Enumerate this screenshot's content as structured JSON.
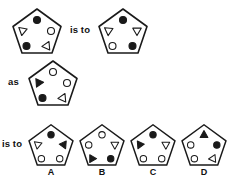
{
  "puzzle": {
    "type": "visual-analogy",
    "connector_1": "is to",
    "connector_2": "as",
    "connector_3": "is to",
    "stroke_color": "#1a1a1a",
    "fill_color": "#1a1a1a",
    "background_color": "#ffffff"
  },
  "premise": {
    "left": {
      "name": "premise-figure-1",
      "shape": "pentagon",
      "elements": [
        {
          "slot": "top",
          "shape": "circle",
          "fill": "filled",
          "rotation": 0
        },
        {
          "slot": "upper-left",
          "shape": "triangle",
          "fill": "open",
          "rotation": 190
        },
        {
          "slot": "upper-right",
          "shape": "circle",
          "fill": "open",
          "rotation": 0
        },
        {
          "slot": "lower-left",
          "shape": "circle",
          "fill": "filled",
          "rotation": 0
        },
        {
          "slot": "lower-right",
          "shape": "triangle",
          "fill": "open",
          "rotation": 265
        }
      ]
    },
    "right": {
      "name": "premise-figure-2",
      "shape": "pentagon",
      "elements": [
        {
          "slot": "top",
          "shape": "circle",
          "fill": "filled",
          "rotation": 0
        },
        {
          "slot": "upper-left",
          "shape": "triangle",
          "fill": "open",
          "rotation": 185
        },
        {
          "slot": "upper-right",
          "shape": "triangle",
          "fill": "open",
          "rotation": 180
        },
        {
          "slot": "lower-left",
          "shape": "circle",
          "fill": "open",
          "rotation": 0
        },
        {
          "slot": "lower-right",
          "shape": "circle",
          "fill": "filled",
          "rotation": 0
        }
      ]
    }
  },
  "analog": {
    "name": "analog-figure",
    "shape": "pentagon",
    "elements": [
      {
        "slot": "top",
        "shape": "circle",
        "fill": "open",
        "rotation": 0
      },
      {
        "slot": "upper-left",
        "shape": "triangle",
        "fill": "filled",
        "rotation": 205
      },
      {
        "slot": "upper-right",
        "shape": "circle",
        "fill": "open",
        "rotation": 0
      },
      {
        "slot": "lower-left",
        "shape": "circle",
        "fill": "filled",
        "rotation": 0
      },
      {
        "slot": "lower-right",
        "shape": "triangle",
        "fill": "open",
        "rotation": 265
      }
    ]
  },
  "options": [
    {
      "label": "A",
      "name": "option-a",
      "shape": "pentagon",
      "elements": [
        {
          "slot": "top",
          "shape": "circle",
          "fill": "filled",
          "rotation": 0
        },
        {
          "slot": "upper-left",
          "shape": "triangle",
          "fill": "open",
          "rotation": 190
        },
        {
          "slot": "upper-right",
          "shape": "triangle",
          "fill": "filled",
          "rotation": 155
        },
        {
          "slot": "lower-left",
          "shape": "circle",
          "fill": "open",
          "rotation": 0
        },
        {
          "slot": "lower-right",
          "shape": "circle",
          "fill": "open",
          "rotation": 0
        }
      ]
    },
    {
      "label": "B",
      "name": "option-b",
      "shape": "pentagon",
      "elements": [
        {
          "slot": "top",
          "shape": "circle",
          "fill": "open",
          "rotation": 0
        },
        {
          "slot": "upper-left",
          "shape": "circle",
          "fill": "open",
          "rotation": 0
        },
        {
          "slot": "upper-right",
          "shape": "triangle",
          "fill": "open",
          "rotation": 180
        },
        {
          "slot": "lower-left",
          "shape": "triangle",
          "fill": "filled",
          "rotation": 90
        },
        {
          "slot": "lower-right",
          "shape": "circle",
          "fill": "filled",
          "rotation": 0
        }
      ]
    },
    {
      "label": "C",
      "name": "option-c",
      "shape": "pentagon",
      "elements": [
        {
          "slot": "top",
          "shape": "circle",
          "fill": "filled",
          "rotation": 0
        },
        {
          "slot": "upper-left",
          "shape": "triangle",
          "fill": "filled",
          "rotation": 205
        },
        {
          "slot": "upper-right",
          "shape": "triangle",
          "fill": "open",
          "rotation": 180
        },
        {
          "slot": "lower-left",
          "shape": "circle",
          "fill": "open",
          "rotation": 0
        },
        {
          "slot": "lower-right",
          "shape": "circle",
          "fill": "open",
          "rotation": 0
        }
      ]
    },
    {
      "label": "D",
      "name": "option-d",
      "shape": "pentagon",
      "elements": [
        {
          "slot": "top",
          "shape": "triangle",
          "fill": "filled",
          "rotation": 0
        },
        {
          "slot": "upper-left",
          "shape": "circle",
          "fill": "open",
          "rotation": 0
        },
        {
          "slot": "upper-right",
          "shape": "circle",
          "fill": "filled",
          "rotation": 0
        },
        {
          "slot": "lower-left",
          "shape": "circle",
          "fill": "open",
          "rotation": 0
        },
        {
          "slot": "lower-right",
          "shape": "triangle",
          "fill": "open",
          "rotation": 265
        }
      ]
    }
  ]
}
